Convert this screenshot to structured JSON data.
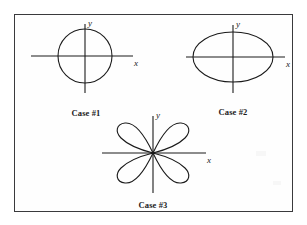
{
  "figure": {
    "border_color": "#3a3a3c",
    "background_color": "#fefefe",
    "stroke_color": "#1a1a1a",
    "cases": [
      {
        "id": "case-1",
        "label": "Case #1",
        "shape": "circle",
        "x_axis_label": "x",
        "y_axis_label": "y",
        "center": [
          84,
          55
        ],
        "rx": 27,
        "ry": 27,
        "x_axis_extent": [
          30,
          132
        ],
        "y_axis_extent": [
          23,
          92
        ]
      },
      {
        "id": "case-2",
        "label": "Case #2",
        "shape": "ellipse-horizontal",
        "x_axis_label": "x",
        "y_axis_label": "y",
        "center": [
          233,
          56
        ],
        "rx": 40,
        "ry": 25,
        "x_axis_extent": [
          186,
          285
        ],
        "y_axis_extent": [
          24,
          92
        ]
      },
      {
        "id": "case-3",
        "label": "Case #3",
        "shape": "bowtie-figure-eight",
        "x_axis_label": "x",
        "y_axis_label": "y",
        "center": [
          152,
          152
        ],
        "rx": 30,
        "ry": 38,
        "x_axis_extent": [
          101,
          205
        ],
        "y_axis_extent": [
          115,
          192
        ]
      }
    ]
  }
}
